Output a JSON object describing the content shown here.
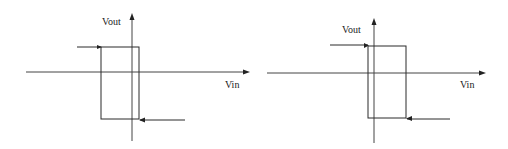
{
  "diagrams": [
    {
      "id": "left",
      "y_label": "Vout",
      "x_label": "Vin",
      "description": "Hysteresis loop with thresholds near / left of origin",
      "axes": {
        "x_axis_y": 72,
        "x_from": 26,
        "x_to": 250,
        "y_axis_x": 132,
        "y_from": 141,
        "y_to": 13
      },
      "loop": {
        "left": 101,
        "right": 139,
        "top": 47,
        "bottom": 119
      },
      "upper_lead": {
        "x_from": 77,
        "x_to": 101,
        "y": 47
      },
      "lower_lead": {
        "x_from": 185,
        "x_to": 139,
        "y": 120
      }
    },
    {
      "id": "right",
      "y_label": "Vout",
      "x_label": "Vin",
      "description": "Hysteresis loop shifted to the right of the origin",
      "axes": {
        "x_axis_y": 73,
        "x_from": 267,
        "x_to": 486,
        "y_axis_x": 374,
        "y_from": 143,
        "y_to": 18
      },
      "loop": {
        "left": 368,
        "right": 406,
        "top": 46,
        "bottom": 118
      },
      "upper_lead": {
        "x_from": 330,
        "x_to": 368,
        "y": 45
      },
      "lower_lead": {
        "x_from": 450,
        "x_to": 406,
        "y": 119
      }
    }
  ],
  "colors": {
    "line": "#2a2a2a",
    "background": "#ffffff"
  }
}
